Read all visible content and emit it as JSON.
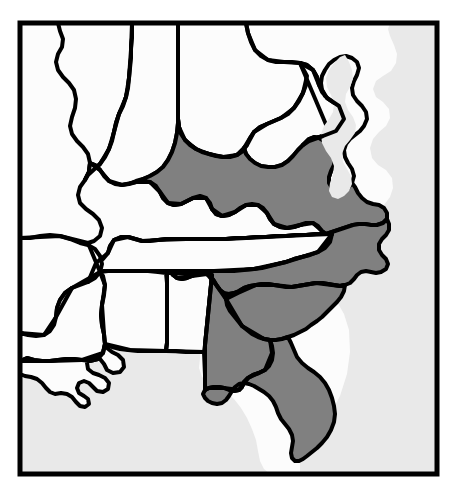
{
  "figure": {
    "kind": "thematic-map",
    "width": 458,
    "height": 494,
    "background_color": "#ffffff",
    "frame": {
      "color": "#000000",
      "stroke_width": 5,
      "x": 20,
      "y": 23,
      "width": 417,
      "height": 451
    }
  },
  "legend_colors": {
    "highlighted_fill": "#808080",
    "unhighlighted_fill": "#fcfcfc",
    "water_fill": "#e9e9e9",
    "border_color": "#000000"
  },
  "water_bodies": [
    {
      "name": "atlantic-ocean",
      "label": "Atlantic Ocean"
    },
    {
      "name": "gulf-of-mexico",
      "label": "Gulf of Mexico"
    },
    {
      "name": "chesapeake-bay",
      "label": "Chesapeake Bay"
    }
  ],
  "highlighted_states": [
    {
      "code": "VA",
      "name": "Virginia"
    },
    {
      "code": "NC",
      "name": "North Carolina"
    },
    {
      "code": "SC",
      "name": "South Carolina"
    },
    {
      "code": "GA",
      "name": "Georgia"
    },
    {
      "code": "FL",
      "name": "Florida"
    }
  ],
  "unhighlighted_states": [
    {
      "code": "IL",
      "name": "Illinois"
    },
    {
      "code": "IN",
      "name": "Indiana"
    },
    {
      "code": "OH",
      "name": "Ohio"
    },
    {
      "code": "KY",
      "name": "Kentucky"
    },
    {
      "code": "WV",
      "name": "West Virginia"
    },
    {
      "code": "MD",
      "name": "Maryland"
    },
    {
      "code": "DE",
      "name": "Delaware"
    },
    {
      "code": "TN",
      "name": "Tennessee"
    },
    {
      "code": "MO",
      "name": "Missouri"
    },
    {
      "code": "AR",
      "name": "Arkansas"
    },
    {
      "code": "MS",
      "name": "Mississippi"
    },
    {
      "code": "AL",
      "name": "Alabama"
    },
    {
      "code": "LA",
      "name": "Louisiana"
    }
  ],
  "shapes": {
    "ocean_atlantic": "M 437,23 L 437,474 L 300,474 L 300,455 L 312,448 L 320,432 L 330,415 L 340,396 L 347,374 L 350,352 L 349,330 L 344,314 L 336,300 L 328,290 L 320,281 L 316,270 L 318,262 L 327,256 L 338,252 L 349,247 L 356,240 L 360,230 L 362,221 L 368,214 L 376,210 L 384,205 L 390,197 L 393,188 L 392,178 L 386,170 L 378,165 L 372,158 L 370,148 L 373,139 L 379,132 L 386,126 L 390,118 L 389,109 L 383,102 L 376,97 L 373,89 L 376,81 L 383,76 L 391,71 L 396,63 L 397,54 L 394,45 L 390,36 L 388,29 L 390,23 Z",
    "ocean_gulf": "M 20,474 L 20,361 L 27,358 L 36,357 L 45,358 L 54,360 L 62,359 L 68,354 L 71,347 L 77,343 L 85,344 L 92,348 L 99,351 L 107,350 L 113,345 L 118,340 L 126,338 L 134,340 L 141,344 L 149,345 L 157,342 L 164,338 L 172,335 L 181,334 L 190,336 L 197,341 L 200,349 L 200,358 L 199,368 L 202,377 L 209,383 L 217,387 L 226,392 L 234,399 L 241,408 L 247,418 L 252,429 L 256,440 L 258,451 L 260,461 L 264,469 L 270,474 Z",
    "ocean_chesapeake": "M 345,55 L 349,62 L 352,70 L 353,79 L 350,87 L 346,94 L 345,102 L 348,110 L 353,117 L 356,125 L 355,133 L 350,140 L 345,146 L 342,154 L 343,162 L 347,169 L 351,176 L 352,184 L 349,191 L 344,196 L 338,199 L 332,197 L 329,191 L 330,183 L 333,175 L 334,166 L 331,158 L 326,151 L 322,143 L 321,134 L 324,126 L 329,119 L 333,112 L 334,103 L 331,95 L 327,87 L 326,78 L 329,70 L 334,63 L 340,57 Z",
    "illinois": "M 20,23 L 58,23 L 60,31 L 63,39 L 62,47 L 58,54 L 56,62 L 58,70 L 63,77 L 69,83 L 74,90 L 76,99 L 75,108 L 72,117 L 70,126 L 72,134 L 77,141 L 83,147 L 88,154 L 90,163 L 89,172 L 85,180 L 80,187 L 78,195 L 80,203 L 86,209 L 93,214 L 99,220 L 102,228 L 100,236 L 94,241 L 86,243 L 78,242 L 70,239 L 62,236 L 54,234 L 46,234 L 38,236 L 30,238 L 22,238 L 20,236 Z",
    "missouri": "M 20,238 L 30,238 L 40,236 L 50,235 L 60,236 L 70,239 L 80,243 L 88,245 L 95,249 L 100,256 L 102,264 L 100,272 L 95,278 L 88,282 L 80,285 L 72,288 L 65,293 L 60,300 L 57,308 L 56,317 L 54,325 L 50,331 L 44,335 L 36,336 L 28,335 L 20,333 Z",
    "arkansas": "M 20,333 L 28,335 L 36,336 L 44,335 L 50,331 L 54,325 L 56,317 L 57,308 L 60,300 L 65,293 L 72,288 L 80,285 L 88,282 L 95,278 L 100,272 L 103,276 L 105,285 L 104,295 L 102,305 L 101,315 L 102,325 L 104,334 L 105,344 L 103,353 L 98,359 L 90,361 L 82,360 L 74,359 L 66,359 L 58,360 L 50,361 L 42,361 L 34,360 L 27,358 L 20,361 Z",
    "louisiana": "M 20,361 L 27,358 L 34,360 L 42,361 L 50,361 L 58,360 L 66,359 L 74,359 L 82,360 L 90,361 L 98,359 L 103,353 L 105,344 L 107,348 L 112,352 L 118,355 L 123,360 L 124,367 L 120,372 L 113,373 L 107,370 L 104,364 L 100,359 L 95,357 L 90,358 L 87,363 L 88,369 L 93,373 L 99,375 L 105,378 L 109,383 L 108,389 L 103,392 L 97,391 L 93,387 L 89,383 L 84,381 L 79,383 L 77,388 L 79,393 L 84,396 L 88,399 L 89,404 L 85,407 L 80,406 L 76,402 L 72,397 L 67,394 L 61,393 L 55,394 L 50,392 L 46,388 L 42,383 L 37,379 L 31,377 L 25,376 L 20,374 Z",
    "mississippi": "M 105,344 L 104,334 L 102,325 L 101,315 L 102,305 L 104,295 L 105,285 L 103,276 L 100,272 L 108,271 L 118,271 L 128,271 L 138,271 L 148,271 L 158,272 L 166,273 L 167,283 L 167,293 L 167,303 L 167,313 L 167,323 L 167,333 L 167,343 L 166,351 L 158,351 L 148,351 L 138,351 L 128,350 L 120,349 L 112,347 Z",
    "alabama": "M 167,283 L 167,273 L 176,273 L 186,273 L 196,274 L 206,274 L 212,275 L 211,285 L 210,295 L 209,305 L 208,315 L 207,325 L 206,335 L 205,345 L 204,352 L 196,352 L 186,352 L 176,351 L 166,351 L 167,343 L 167,333 L 167,323 L 167,313 L 167,303 L 167,293 Z",
    "tennessee": "M 100,272 L 95,278 L 88,282 L 87,275 L 90,268 L 96,263 L 103,259 L 108,253 L 110,246 L 114,240 L 121,237 L 128,237 L 135,239 L 142,241 L 150,241 L 158,240 L 166,239 L 176,239 L 186,239 L 196,239 L 206,239 L 216,239 L 226,239 L 236,238 L 246,238 L 256,237 L 266,237 L 276,236 L 286,236 L 296,235 L 306,235 L 316,234 L 326,234 L 332,234 L 330,242 L 325,248 L 318,252 L 310,255 L 302,257 L 294,259 L 286,262 L 278,264 L 270,266 L 262,268 L 254,269 L 244,270 L 234,271 L 224,271 L 214,271 L 204,271 L 194,271 L 184,271 L 174,271 L 164,271 L 154,271 L 144,271 L 134,271 L 124,271 L 114,271 L 104,271 Z",
    "kentucky": "M 88,243 L 94,241 L 100,236 L 102,228 L 99,220 L 93,214 L 86,209 L 80,203 L 78,195 L 80,187 L 85,180 L 89,172 L 90,163 L 95,165 L 100,170 L 104,176 L 109,181 L 115,184 L 122,185 L 129,184 L 136,182 L 143,181 L 150,182 L 156,186 L 160,192 L 163,198 L 168,203 L 174,205 L 181,204 L 187,201 L 193,198 L 200,196 L 206,198 L 210,203 L 212,209 L 216,214 L 222,216 L 229,215 L 235,212 L 240,208 L 246,205 L 252,204 L 258,205 L 263,208 L 267,213 L 270,219 L 274,224 L 280,227 L 287,228 L 294,227 L 300,225 L 306,223 L 313,223 L 318,226 L 322,231 L 326,234 L 316,234 L 306,235 L 296,235 L 286,236 L 276,236 L 266,237 L 256,237 L 246,238 L 236,238 L 226,239 L 216,239 L 206,239 L 196,239 L 186,239 L 176,239 L 166,239 L 158,240 L 150,241 L 142,241 L 135,239 L 128,237 L 121,237 L 114,240 L 110,246 L 108,253 L 103,259 L 96,263 L 90,268 L 87,275 L 88,282 L 95,278 Z",
    "indiana": "M 132,23 L 178,23 L 178,33 L 178,43 L 178,53 L 178,63 L 178,73 L 178,83 L 178,93 L 178,103 L 178,113 L 178,123 L 177,133 L 175,143 L 172,152 L 168,160 L 163,167 L 157,172 L 150,176 L 143,179 L 136,181 L 129,184 L 122,185 L 115,184 L 109,181 L 104,176 L 100,170 L 95,165 L 90,163 L 89,172 L 85,180 L 88,175 L 94,170 L 100,164 L 105,157 L 109,149 L 112,141 L 114,132 L 116,123 L 119,114 L 123,106 L 126,97 L 128,88 L 129,78 L 130,68 L 131,58 L 131,48 L 132,38 Z",
    "illinois_east_edge": "M 58,23 L 132,23 L 132,38 L 131,48 L 131,58 L 130,68 L 129,78 L 128,88 L 126,97 L 123,106 L 119,114 L 116,123 L 114,132 L 112,141 L 109,149 L 105,157 L 100,164 L 94,170 L 88,175 L 85,180 L 89,172 L 90,163 L 88,154 L 83,147 L 77,141 L 72,134 L 70,126 L 72,117 L 75,108 L 76,99 L 74,90 L 69,83 L 63,77 L 58,70 L 56,62 L 58,54 L 62,47 L 63,39 L 60,31 Z",
    "ohio": "M 178,23 L 246,23 L 248,33 L 251,42 L 255,50 L 261,56 L 268,60 L 276,62 L 284,62 L 292,62 L 300,63 L 305,68 L 307,76 L 306,85 L 303,93 L 299,101 L 294,108 L 288,114 L 281,118 L 274,121 L 267,124 L 260,127 L 254,132 L 250,138 L 247,145 L 243,151 L 237,155 L 230,157 L 223,157 L 216,156 L 209,154 L 202,152 L 196,149 L 190,145 L 185,140 L 181,134 L 179,127 L 178,119 L 178,109 L 178,99 L 178,89 L 178,79 L 178,69 L 178,59 L 178,49 L 178,39 L 178,33 Z",
    "westvirginia": "M 250,138 L 254,132 L 260,127 L 267,124 L 274,121 L 281,118 L 288,114 L 294,108 L 299,101 L 303,93 L 306,85 L 307,76 L 305,68 L 300,63 L 307,65 L 313,70 L 317,77 L 319,85 L 322,92 L 327,98 L 333,102 L 339,106 L 343,112 L 344,119 L 341,126 L 336,131 L 330,134 L 323,136 L 316,138 L 309,141 L 303,145 L 298,150 L 293,156 L 288,161 L 282,165 L 275,167 L 268,167 L 261,166 L 255,163 L 250,159 L 246,154 L 244,148 Z",
    "maryland_delaware": "M 300,63 L 307,65 L 313,70 L 317,77 L 319,85 L 322,92 L 327,98 L 333,102 L 339,106 L 343,112 L 344,119 L 341,126 L 336,131 L 330,134 L 331,128 L 335,123 L 340,119 L 343,113 L 341,107 L 336,103 L 330,100 L 325,96 L 322,90 L 321,83 L 322,76 L 325,70 L 329,64 L 334,60 L 340,57 L 346,56 L 352,58 L 357,62 L 359,68 L 357,75 L 354,81 L 352,88 L 353,95 L 357,101 L 362,106 L 366,112 L 367,119 L 364,126 L 360,131 L 355,135 L 350,139 L 346,144 L 344,150 L 345,157 L 348,163 L 352,169 L 354,176 L 352,183 L 348,188 L 343,191 L 337,191 L 332,188 L 329,183 L 329,177 L 331,171 L 334,165 L 335,158 L 333,151 L 329,145 L 324,141 L 319,138 L 314,137 L 309,139 L 305,143 L 303,145 L 309,141 L 316,138 L 323,136 L 330,134 Z",
    "virginia": "M 250,159 L 255,163 L 261,166 L 268,167 L 275,167 L 282,165 L 288,161 L 293,156 L 298,150 L 303,145 L 305,143 L 309,139 L 314,137 L 319,138 L 324,141 L 329,145 L 333,151 L 335,158 L 334,165 L 331,171 L 329,177 L 329,183 L 332,188 L 337,191 L 343,191 L 348,188 L 352,183 L 355,187 L 358,193 L 362,198 L 367,202 L 373,204 L 379,205 L 384,208 L 387,213 L 387,219 L 383,223 L 377,225 L 371,225 L 365,224 L 359,224 L 353,225 L 347,227 L 341,229 L 335,231 L 329,233 L 326,234 L 322,231 L 318,226 L 313,223 L 306,223 L 300,225 L 294,227 L 287,228 L 280,227 L 274,224 L 270,219 L 267,213 L 263,208 L 258,205 L 252,204 L 246,205 L 240,208 L 235,212 L 229,215 L 222,216 L 216,214 L 212,209 L 210,203 L 206,198 L 200,196 L 193,198 L 187,201 L 181,204 L 174,205 L 168,203 L 163,198 L 160,192 L 156,186 L 150,182 L 143,181 L 136,182 L 143,179 L 150,176 L 157,172 L 163,167 L 168,160 L 172,152 L 175,143 L 177,133 L 178,123 L 178,119 L 179,127 L 181,134 L 185,140 L 190,145 L 196,149 L 202,152 L 209,154 L 216,156 L 223,157 L 230,157 L 237,155 L 243,151 L 247,145 L 244,148 L 246,154 Z",
    "northcarolina": "M 326,234 L 329,233 L 335,231 L 341,229 L 347,227 L 353,225 L 359,224 L 365,224 L 371,225 L 377,225 L 383,223 L 387,219 L 389,224 L 389,230 L 386,235 L 382,239 L 379,244 L 379,250 L 382,255 L 386,259 L 388,264 L 386,269 L 381,272 L 376,273 L 371,272 L 366,271 L 361,272 L 357,275 L 354,279 L 350,283 L 345,285 L 340,286 L 334,285 L 328,284 L 322,283 L 316,283 L 310,284 L 304,285 L 298,286 L 292,287 L 286,287 L 280,286 L 274,285 L 268,284 L 262,284 L 256,285 L 250,286 L 244,288 L 239,291 L 234,293 L 229,294 L 224,293 L 220,290 L 217,286 L 214,281 L 211,277 L 207,274 L 202,273 L 197,274 L 192,276 L 187,278 L 182,279 L 177,278 L 173,275 L 170,271 L 174,271 L 184,271 L 194,271 L 204,271 L 214,271 L 224,271 L 234,271 L 244,270 L 254,269 L 262,268 L 270,266 L 278,264 L 286,262 L 294,259 L 302,257 L 310,255 L 318,252 L 325,248 L 330,242 L 332,234 Z",
    "southcarolina": "M 229,294 L 234,293 L 239,291 L 244,288 L 250,286 L 256,285 L 262,284 L 268,284 L 274,285 L 280,286 L 286,287 L 292,287 L 298,286 L 304,285 L 310,284 L 316,283 L 322,283 L 328,284 L 334,285 L 340,286 L 345,285 L 344,291 L 341,297 L 337,302 L 332,307 L 327,312 L 322,317 L 317,321 L 311,325 L 306,329 L 300,332 L 294,335 L 288,337 L 282,339 L 276,340 L 270,340 L 264,339 L 258,337 L 252,334 L 247,330 L 242,326 L 238,321 L 234,316 L 230,311 L 227,305 L 226,299 Z",
    "georgia": "M 212,275 L 206,274 L 196,274 L 186,273 L 176,273 L 170,271 L 173,275 L 177,278 L 182,279 L 187,278 L 192,276 L 197,274 L 202,273 L 207,274 L 211,277 L 214,281 L 217,286 L 220,290 L 224,293 L 226,299 L 227,305 L 230,311 L 234,316 L 238,321 L 242,326 L 247,330 L 252,334 L 258,337 L 264,339 L 270,340 L 272,346 L 273,353 L 272,360 L 269,366 L 265,370 L 259,373 L 253,375 L 248,378 L 244,382 L 242,387 L 239,390 L 234,391 L 229,390 L 224,388 L 219,387 L 214,387 L 209,388 L 205,390 L 205,383 L 205,375 L 205,367 L 205,359 L 205,352 L 205,345 L 206,335 L 207,325 L 208,315 L 209,305 L 210,295 L 211,285 Z",
    "florida": "M 205,390 L 209,388 L 214,387 L 219,387 L 224,388 L 229,390 L 234,391 L 239,390 L 242,387 L 244,382 L 248,378 L 253,375 L 259,373 L 265,370 L 269,366 L 272,360 L 273,353 L 272,346 L 270,340 L 276,340 L 282,339 L 288,337 L 291,343 L 294,350 L 297,357 L 302,363 L 308,368 L 314,372 L 320,377 L 325,383 L 329,390 L 332,398 L 334,406 L 335,414 L 334,422 L 331,430 L 327,437 L 322,443 L 317,448 L 312,452 L 307,456 L 303,459 L 299,461 L 295,461 L 292,458 L 291,453 L 292,447 L 293,441 L 292,435 L 289,429 L 285,424 L 281,419 L 278,413 L 276,407 L 273,401 L 269,396 L 264,392 L 259,389 L 254,386 L 249,384 L 244,383 L 239,384 L 235,387 L 232,391 L 229,396 L 226,400 L 222,403 L 217,404 L 212,403 L 208,401 L 205,398 L 203,394 Z",
    "inner_borders": [
      "M 132,23 L 131,50 L 129,78 L 126,97 L 119,114 L 114,132 L 109,149 L 100,164 L 88,175 L 85,180",
      "M 178,23 L 178,60 L 178,100 L 178,119 L 179,127 L 185,140 L 196,149 L 209,154 L 223,157 L 237,155 L 247,145 L 254,132 L 267,124 L 281,118 L 294,108 L 303,93 L 307,76 L 300,63 L 284,62 L 268,60 L 255,50 L 248,33 L 246,23",
      "M 300,63 L 313,70 L 319,85 L 327,98 L 339,106 L 344,119 L 336,131 L 323,136 L 309,141 L 303,145",
      "M 90,163 L 100,170 L 109,181 L 122,185 L 136,182 L 150,182 L 160,192 L 168,203 L 181,204 L 193,198 L 206,198 L 212,209 L 222,216 L 235,212 L 246,205 L 258,205 L 267,213 L 274,224 L 287,228 L 300,225 L 313,223 L 322,231 L 326,234",
      "M 88,282 L 96,263 L 108,253 L 114,240 L 128,237 L 142,241 L 158,240 L 186,239 L 226,239 L 266,237 L 306,235 L 332,234",
      "M 170,271 L 214,271 L 254,269 L 286,262 L 318,252 L 332,234",
      "M 20,238 L 60,236 L 88,243 L 100,272",
      "M 20,333 L 44,335 L 56,317 L 72,288 L 100,272",
      "M 100,272 L 105,285 L 102,305 L 104,334 L 105,344",
      "M 167,271 L 167,303 L 167,343 L 166,351",
      "M 105,344 L 130,350 L 166,351 L 204,352 L 205,375 L 205,390",
      "M 212,275 L 211,285 L 208,315 L 205,345 L 205,352",
      "M 20,361 L 50,361 L 82,360 L 103,353 L 105,344",
      "M 170,271 L 177,278 L 192,276 L 207,274 L 217,286 L 226,299 L 242,326 L 264,339 L 270,340",
      "M 226,299 L 238,293 L 256,285 L 274,285 L 292,287 L 316,283 L 340,286 L 345,285",
      "M 270,340 L 272,353 L 265,370 L 248,378 L 239,390 L 224,388 L 209,388 L 205,390"
    ]
  }
}
